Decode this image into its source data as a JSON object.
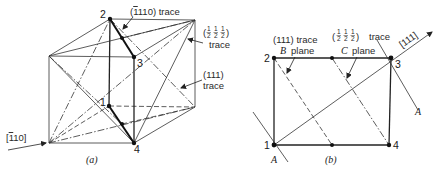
{
  "figure_a": {
    "caption": "(a)",
    "points": [
      {
        "label": "1",
        "x": 109,
        "y": 106
      },
      {
        "label": "2",
        "x": 110,
        "y": 19
      },
      {
        "label": "3",
        "x": 134,
        "y": 57
      },
      {
        "label": "4",
        "x": 134,
        "y": 143
      }
    ],
    "labels": {
      "trace_110": "(̄110) trace",
      "trace_110_text": "110) trace",
      "trace_110_prefix": "(",
      "trace_110_bar_digit": "1",
      "half_trace_open": "(",
      "half_trace_close": ")",
      "half_frac_num": "1",
      "half_frac_den": "2",
      "half_trace_word": "trace",
      "trace_111": "(111)",
      "trace_111_word": "trace",
      "direction_110": "[̄110]",
      "direction_110_prefix": "[",
      "direction_110_bar_digit": "1",
      "direction_110_rest": "10]"
    }
  },
  "figure_b": {
    "caption": "(b)",
    "points": [
      {
        "label": "1",
        "x": 274,
        "y": 145
      },
      {
        "label": "2",
        "x": 274,
        "y": 58
      },
      {
        "label": "3",
        "x": 391,
        "y": 58
      },
      {
        "label": "4",
        "x": 389,
        "y": 145
      }
    ],
    "labels": {
      "trace_111": "(111)  trace",
      "b_plane_letter": "B",
      "b_plane_word": "plane",
      "half_trace_open": "(",
      "half_trace_close": ")",
      "half_frac_num": "1",
      "half_frac_den": "2",
      "half_trace_word": "trace",
      "c_plane_letter": "C",
      "c_plane_word": "plane",
      "direction_111": "[111]",
      "a_plane_top": "A",
      "a_plane_bottom": "A"
    }
  }
}
